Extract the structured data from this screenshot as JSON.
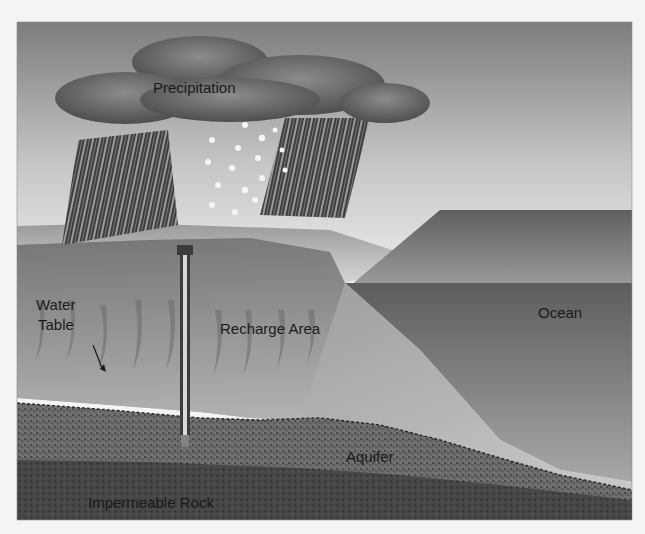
{
  "figure": {
    "labels": {
      "precipitation": "Precipitation",
      "water_table_line1": "Water",
      "water_table_line2": "Table",
      "recharge_area": "Recharge Area",
      "ocean": "Ocean",
      "aquifer": "Aquifer",
      "impermeable_rock": "Impermeable Rock"
    },
    "colors": {
      "background": "#f4f4f4",
      "sky_top": "#7d7d7d",
      "sky_bottom": "#ececec",
      "cloud": "#6b6b6b",
      "rain_band": "#4a4a4a",
      "land_surface": "#c8c8c8",
      "unsaturated_zone": "#8e8e8e",
      "ocean": "#7a7a7a",
      "aquifer": "#5e5e5e",
      "impermeable_rock": "#3e3e3e",
      "text": "#1a1a1a"
    }
  }
}
